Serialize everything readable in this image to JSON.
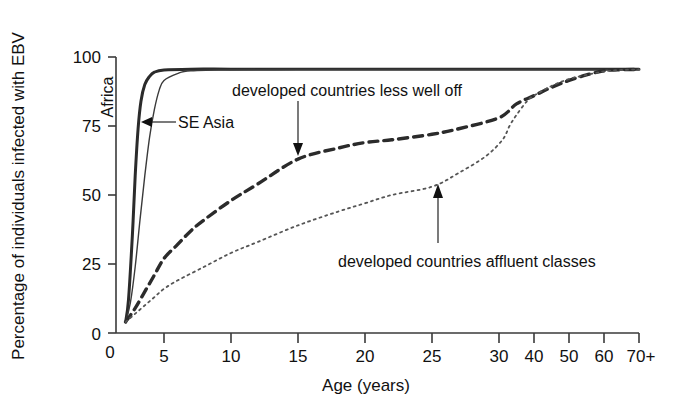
{
  "chart_data": {
    "type": "line",
    "title": "",
    "xlabel": "Age (years)",
    "ylabel": "Percentage of individuals infected with EBV",
    "xlim": [
      0,
      70
    ],
    "ylim": [
      0,
      100
    ],
    "grid": false,
    "legend_position": "inline-annotations",
    "x_tick_labels": [
      "0",
      "5",
      "10",
      "15",
      "20",
      "25",
      "30",
      "40",
      "50",
      "60",
      "70+"
    ],
    "x_tick_values": [
      0,
      5,
      10,
      15,
      20,
      25,
      30,
      40,
      50,
      60,
      70
    ],
    "y_tick_labels": [
      "0",
      "25",
      "50",
      "75",
      "100"
    ],
    "y_tick_values": [
      0,
      25,
      50,
      75,
      100
    ],
    "series": [
      {
        "name": "Africa",
        "style": "solid-thick",
        "x": [
          1,
          1.3,
          1.7,
          2.0,
          2.3,
          2.6,
          3.0,
          3.5,
          4,
          5,
          7,
          10,
          15,
          20,
          25,
          30,
          40,
          50,
          60,
          70
        ],
        "values": [
          4,
          12,
          35,
          57,
          74,
          84,
          90,
          93,
          94.5,
          95.3,
          95.6,
          95.6,
          95.6,
          95.6,
          95.6,
          95.6,
          95.6,
          95.6,
          95.6,
          95.6
        ]
      },
      {
        "name": "SE Asia",
        "style": "solid-thin",
        "x": [
          1,
          1.5,
          2.0,
          2.5,
          3.0,
          3.5,
          4.0,
          4.5,
          5.0,
          6,
          7,
          10,
          15,
          20,
          25,
          30,
          40,
          50,
          60,
          70
        ],
        "values": [
          4,
          11,
          24,
          41,
          57,
          71,
          81,
          88,
          91.5,
          94,
          95,
          95.4,
          95.5,
          95.5,
          95.5,
          95.5,
          95.5,
          95.5,
          95.5,
          95.5
        ]
      },
      {
        "name": "developed countries less well off",
        "style": "dashed",
        "x": [
          1,
          2,
          3,
          4,
          5,
          6,
          7,
          8,
          10,
          12,
          15,
          18,
          20,
          22,
          25,
          27,
          30,
          35,
          40,
          45,
          50,
          55,
          60,
          65,
          70
        ],
        "values": [
          4,
          9,
          15,
          21,
          27,
          32,
          37,
          41,
          48,
          54,
          63,
          67,
          69,
          70,
          72,
          74,
          78,
          83,
          86,
          89,
          91.5,
          93.5,
          95,
          95.4,
          95.5
        ]
      },
      {
        "name": "developed countries affluent classes",
        "style": "dotted",
        "x": [
          1,
          2,
          3,
          4,
          5,
          6,
          8,
          10,
          12,
          15,
          18,
          20,
          22,
          25,
          27,
          29,
          31,
          33,
          35,
          38,
          40,
          45,
          50,
          55,
          60,
          65,
          70
        ],
        "values": [
          4,
          7,
          10,
          13,
          16,
          19,
          24,
          29,
          33,
          39,
          44,
          47,
          50,
          53,
          58,
          64,
          70,
          75,
          79,
          84,
          86,
          89.5,
          92,
          93.5,
          94.8,
          95.3,
          95.5
        ]
      }
    ],
    "annotations": [
      {
        "text": "Africa",
        "kind": "rotated-inline-label",
        "rotation": -90
      },
      {
        "text": "SE Asia",
        "kind": "arrow-label",
        "arrow_direction": "left",
        "points_to_series": "SE Asia"
      },
      {
        "text": "developed countries less well off",
        "kind": "arrow-label",
        "arrow_direction": "down",
        "points_to_series": "developed countries less well off",
        "points_at_x": 15
      },
      {
        "text": "developed countries affluent classes",
        "kind": "arrow-label",
        "arrow_direction": "up",
        "points_to_series": "developed countries affluent classes",
        "points_at_x": 25
      }
    ],
    "colors": {
      "axis": "#3a3a3a",
      "africa": "#2b2b2b",
      "se_asia": "#3a3a3a",
      "less_well_off": "#2b2b2b",
      "affluent": "#555555",
      "text": "#111111",
      "background": "#ffffff"
    }
  }
}
